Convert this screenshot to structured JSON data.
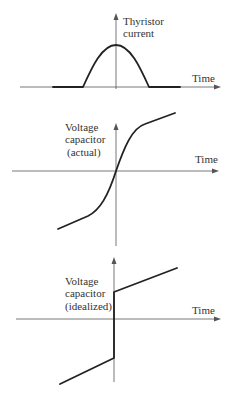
{
  "panels": [
    {
      "id": "thyristor-current",
      "y_label_lines": [
        "Thyristor",
        "current"
      ],
      "x_label": "Time",
      "description": "Half-sine current pulse centred on the vertical axis, zero before and after"
    },
    {
      "id": "voltage-capacitor-actual",
      "y_label_lines": [
        "Voltage",
        "capacitor",
        "(actual)"
      ],
      "x_label": "Time",
      "description": "S-shaped voltage curve passing through origin, linear slopes at both ends"
    },
    {
      "id": "voltage-capacitor-idealized",
      "y_label_lines": [
        "Voltage",
        "capacitor",
        "(idealized)"
      ],
      "x_label": "Time",
      "description": "Linear ramp with an instantaneous vertical step at the origin"
    }
  ],
  "colors": {
    "curve": "#222222",
    "axis": "#555555",
    "text": "#333333",
    "background": "#ffffff"
  }
}
